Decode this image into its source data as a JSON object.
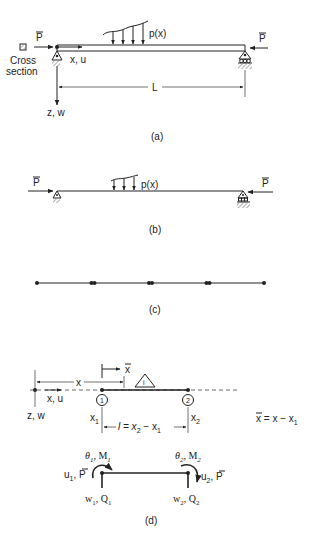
{
  "figure": {
    "a": {
      "caption": "(a)",
      "force_left": "P",
      "force_right": "P",
      "cross_section_label_1": "Cross",
      "cross_section_label_2": "section",
      "load_label": "p(x)",
      "axis_x_label": "x, u",
      "axis_z_label": "z, w",
      "length_label": "L"
    },
    "b": {
      "caption": "(b)",
      "force_left": "P",
      "force_right": "P",
      "load_label": "p(x)"
    },
    "c": {
      "caption": "(c)",
      "element_count": 4
    },
    "d": {
      "caption": "(d)",
      "xbar_label": "x",
      "element_label": "i",
      "x_dim_label": "x",
      "axis_x_label": "x, u",
      "axis_z_label": "z, w",
      "node1_label": "1",
      "node2_label": "2",
      "x1_label": "x",
      "x1_sub": "1",
      "x2_label": "x",
      "x2_sub": "2",
      "length_eq": "l = x",
      "length_eq_sub2": "2",
      "length_eq_mid": " − x",
      "length_eq_sub1": "1",
      "xbar_eq_left": "x",
      "xbar_eq_right": " = x − x",
      "xbar_eq_sub": "1",
      "theta1": "θ",
      "theta1_sub": "1",
      "m1": ", M",
      "m1_sub": "1",
      "theta2": "θ",
      "theta2_sub": "2",
      "m2": ", M",
      "m2_sub": "2",
      "u1": "u",
      "u1_sub": "1",
      "u1_tail": ", P",
      "u2": "u",
      "u2_sub": "2",
      "u2_tail": ", P",
      "w1": "w",
      "w1_sub": "1",
      "w1_tail": ", Q",
      "w1_tail_sub": "1",
      "w2": "w",
      "w2_sub": "2",
      "w2_tail": ", Q",
      "w2_tail_sub": "2"
    }
  }
}
